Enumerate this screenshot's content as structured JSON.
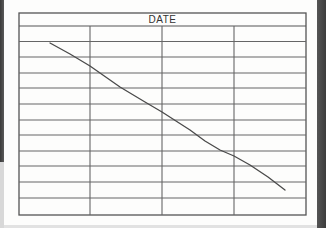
{
  "chart_data": {
    "type": "line",
    "title": "DATE",
    "xlabel": "",
    "ylabel": "",
    "grid": true,
    "legend": null,
    "columns": 4,
    "rows": 12,
    "series": [
      {
        "name": "hand-drawn trend",
        "color": "#4a4a4a",
        "points_px": [
          [
            50,
            43
          ],
          [
            70,
            54
          ],
          [
            90,
            66
          ],
          [
            120,
            87
          ],
          [
            145,
            102
          ],
          [
            162,
            112
          ],
          [
            190,
            130
          ],
          [
            205,
            141
          ],
          [
            220,
            150
          ],
          [
            234,
            156
          ],
          [
            250,
            165
          ],
          [
            268,
            177
          ],
          [
            285,
            190
          ]
        ]
      }
    ]
  },
  "form": {
    "header_label": "DATE",
    "frame": {
      "left": 19,
      "top": 13,
      "right": 306,
      "bottom": 215
    },
    "header_bottom": 26,
    "column_lines_x": [
      90,
      162,
      234
    ],
    "row_lines_y": [
      41.5,
      57,
      73,
      88,
      104,
      120,
      135,
      151,
      166,
      182,
      198
    ],
    "line_color": "#666666",
    "frame_color": "#555555"
  }
}
